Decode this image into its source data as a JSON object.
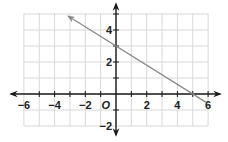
{
  "chart_data": {
    "type": "line",
    "title": "",
    "xlabel": "",
    "ylabel": "",
    "origin_label": "O",
    "xlim": [
      -6,
      6
    ],
    "ylim": [
      -2,
      5
    ],
    "grid": true,
    "x_tick_labels": [
      "−6",
      "−4",
      "−2",
      "2",
      "4",
      "6"
    ],
    "x_tick_values": [
      -6,
      -4,
      -2,
      2,
      4,
      6
    ],
    "y_tick_labels": [
      "−2",
      "2",
      "4"
    ],
    "y_tick_values": [
      -2,
      2,
      4
    ],
    "series": [
      {
        "name": "line",
        "equation": "y = -0.6x + 3",
        "x": [
          -3.1,
          5.85
        ],
        "y": [
          4.86,
          -0.51
        ],
        "arrow_at_start": true,
        "arrow_at_end": false,
        "color": "#8a8a8a"
      }
    ],
    "intercepts": {
      "y_intercept": [
        0,
        3
      ],
      "x_intercept": [
        5,
        0
      ]
    }
  },
  "colors": {
    "grid": "#d8d8d8",
    "axis": "#1a1a1a",
    "line": "#8a8a8a"
  }
}
